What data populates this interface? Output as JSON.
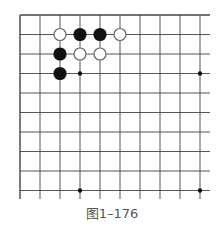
{
  "diagram": {
    "caption": "图1–176",
    "grid": {
      "cols": 10,
      "rows": 10,
      "x0": 20,
      "y0": 15,
      "dx": 20,
      "dy": 19.5,
      "line_color": "#444444",
      "right_edge": 210,
      "bottom_edge": 199
    },
    "stones": [
      {
        "color": "white",
        "col": 2,
        "row": 1
      },
      {
        "color": "black",
        "col": 3,
        "row": 1
      },
      {
        "color": "black",
        "col": 4,
        "row": 1
      },
      {
        "color": "white",
        "col": 5,
        "row": 1
      },
      {
        "color": "black",
        "col": 2,
        "row": 2
      },
      {
        "color": "white",
        "col": 3,
        "row": 2
      },
      {
        "color": "white",
        "col": 4,
        "row": 2
      },
      {
        "color": "black",
        "col": 2,
        "row": 3
      }
    ],
    "star_points": [
      {
        "col": 3,
        "row": 3
      },
      {
        "col": 9,
        "row": 3
      },
      {
        "col": 3,
        "row": 9
      },
      {
        "col": 9,
        "row": 9
      }
    ]
  }
}
